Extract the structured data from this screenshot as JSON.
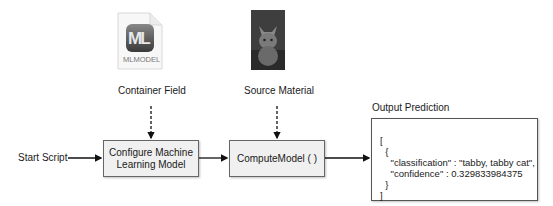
{
  "diagram": {
    "container_icon": {
      "badge_text": "ML",
      "file_type_label": "MLMODEL"
    },
    "container_label": "Container Field",
    "source_image": {
      "description": "photo of a tabby kitten"
    },
    "source_label": "Source Material",
    "start_label": "Start Script",
    "configure_box": {
      "line1": "Configure Machine",
      "line2": "Learning Model"
    },
    "compute_box": {
      "label": "ComputeModel ( )"
    },
    "output_title": "Output Prediction",
    "output_json": {
      "lines": [
        "[",
        "  {",
        "    \"classification\" : \"tabby, tabby cat\",",
        "    \"confidence\" : 0.329833984375",
        "  }",
        "]"
      ]
    },
    "colors": {
      "box_fill": "#f0f0f0",
      "box_border": "#666666",
      "arrow": "#111111"
    }
  }
}
